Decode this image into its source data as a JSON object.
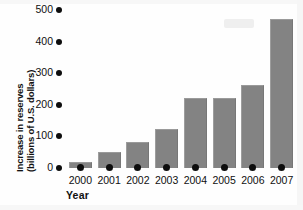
{
  "chart_data": {
    "type": "bar",
    "title": "",
    "subtitle": "",
    "xlabel": "Year",
    "ylabel": "Increase in reserves (billions of U.S. dollars)",
    "ylabel_line1": "Increase in reserves",
    "ylabel_line2": "(billions of U.S. dollars)",
    "categories": [
      "2000",
      "2001",
      "2002",
      "2003",
      "2004",
      "2005",
      "2006",
      "2007"
    ],
    "values": [
      20,
      50,
      83,
      123,
      220,
      222,
      262,
      473
    ],
    "ylim": [
      0,
      500
    ],
    "yticks": [
      0,
      100,
      200,
      300,
      400,
      500
    ],
    "ytick_labels": [
      "0",
      "100",
      "200",
      "300",
      "400",
      "500"
    ],
    "xtick_labels": [
      "2000",
      "2001",
      "2002",
      "2003",
      "2004",
      "2005",
      "2006",
      "2007"
    ],
    "grid": false,
    "legend": false,
    "legend_position": "none",
    "series": [
      {
        "name": "Increase in reserves",
        "values": [
          20,
          50,
          83,
          123,
          220,
          222,
          262,
          473
        ]
      }
    ],
    "tick_marker_style": "filled-circle",
    "bar_color": "#838383",
    "axis_color": "#0d0d0d",
    "background_color": "#ffffff"
  }
}
